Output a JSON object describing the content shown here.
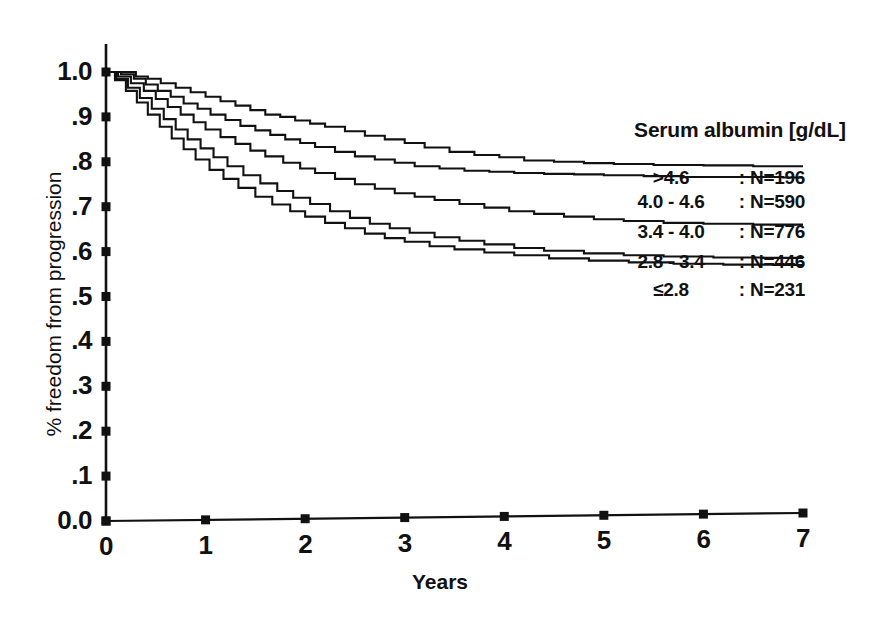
{
  "chart_data": {
    "type": "line",
    "title": "",
    "xlabel": "Years",
    "ylabel": "% freedom from progression",
    "xlim": [
      0,
      7
    ],
    "ylim": [
      0,
      1
    ],
    "grid": false,
    "legend_position": "right",
    "legend_title": "Serum albumin [g/dL]",
    "x_ticks": [
      "0",
      "1",
      "2",
      "3",
      "4",
      "5",
      "6",
      "7"
    ],
    "x_tick_values": [
      0,
      1,
      2,
      3,
      4,
      5,
      6,
      7
    ],
    "y_ticks": [
      "0.0",
      ".1",
      ".2",
      ".3",
      ".4",
      ".5",
      ".6",
      ".7",
      ".8",
      ".9",
      "1.0"
    ],
    "y_tick_values": [
      0,
      0.1,
      0.2,
      0.3,
      0.4,
      0.5,
      0.6,
      0.7,
      0.8,
      0.9,
      1.0
    ],
    "line_color": "#111111",
    "series": [
      {
        "name": ">4.6",
        "n_label": "N=196",
        "n": 196,
        "separator": ":",
        "x": [
          0,
          0.18,
          0.3,
          0.42,
          0.55,
          0.7,
          0.85,
          1.0,
          1.15,
          1.3,
          1.45,
          1.6,
          1.75,
          1.9,
          2.05,
          2.2,
          2.4,
          2.6,
          2.8,
          3.0,
          3.2,
          3.45,
          3.7,
          3.95,
          4.2,
          4.5,
          4.8,
          5.1,
          5.5,
          6.0,
          6.5,
          7.0
        ],
        "values": [
          1.0,
          1.0,
          0.99,
          0.985,
          0.975,
          0.965,
          0.955,
          0.945,
          0.935,
          0.925,
          0.915,
          0.905,
          0.9,
          0.892,
          0.885,
          0.878,
          0.868,
          0.858,
          0.85,
          0.842,
          0.832,
          0.822,
          0.815,
          0.81,
          0.803,
          0.8,
          0.797,
          0.795,
          0.793,
          0.792,
          0.79,
          0.79
        ]
      },
      {
        "name": "4.0 - 4.6",
        "n_label": "N=590",
        "n": 590,
        "separator": ":",
        "x": [
          0,
          0.15,
          0.28,
          0.4,
          0.52,
          0.65,
          0.78,
          0.92,
          1.05,
          1.2,
          1.35,
          1.5,
          1.65,
          1.8,
          1.95,
          2.1,
          2.3,
          2.5,
          2.7,
          2.9,
          3.1,
          3.35,
          3.6,
          3.85,
          4.1,
          4.4,
          4.7,
          5.0,
          5.4,
          5.8,
          6.3,
          6.8,
          7.0
        ],
        "values": [
          1.0,
          0.995,
          0.985,
          0.972,
          0.958,
          0.945,
          0.93,
          0.918,
          0.905,
          0.893,
          0.88,
          0.87,
          0.86,
          0.85,
          0.842,
          0.833,
          0.822,
          0.812,
          0.805,
          0.798,
          0.79,
          0.785,
          0.78,
          0.778,
          0.775,
          0.773,
          0.772,
          0.77,
          0.768,
          0.766,
          0.766,
          0.765,
          0.765
        ]
      },
      {
        "name": "3.4 - 4.0",
        "n_label": "N=776",
        "n": 776,
        "separator": ":",
        "x": [
          0,
          0.12,
          0.25,
          0.38,
          0.5,
          0.62,
          0.75,
          0.88,
          1.0,
          1.15,
          1.3,
          1.45,
          1.6,
          1.78,
          1.95,
          2.1,
          2.3,
          2.5,
          2.7,
          2.9,
          3.1,
          3.3,
          3.55,
          3.8,
          4.05,
          4.3,
          4.6,
          4.9,
          5.2,
          5.6,
          6.0,
          6.5,
          7.0
        ],
        "values": [
          1.0,
          0.99,
          0.975,
          0.958,
          0.94,
          0.922,
          0.905,
          0.888,
          0.872,
          0.855,
          0.84,
          0.825,
          0.812,
          0.798,
          0.785,
          0.775,
          0.762,
          0.75,
          0.74,
          0.73,
          0.722,
          0.715,
          0.706,
          0.698,
          0.69,
          0.684,
          0.678,
          0.672,
          0.668,
          0.664,
          0.662,
          0.66,
          0.66
        ]
      },
      {
        "name": "2.8 - 3.4",
        "n_label": "N=446",
        "n": 446,
        "separator": ":",
        "x": [
          0,
          0.1,
          0.22,
          0.34,
          0.46,
          0.58,
          0.7,
          0.82,
          0.95,
          1.08,
          1.22,
          1.38,
          1.55,
          1.72,
          1.88,
          2.05,
          2.25,
          2.45,
          2.65,
          2.85,
          3.05,
          3.3,
          3.55,
          3.8,
          4.1,
          4.4,
          4.8,
          5.2,
          5.6,
          6.1,
          6.6,
          7.0
        ],
        "values": [
          1.0,
          0.985,
          0.965,
          0.942,
          0.918,
          0.895,
          0.872,
          0.85,
          0.83,
          0.81,
          0.79,
          0.77,
          0.752,
          0.735,
          0.72,
          0.706,
          0.69,
          0.675,
          0.662,
          0.652,
          0.642,
          0.632,
          0.624,
          0.616,
          0.608,
          0.602,
          0.596,
          0.592,
          0.589,
          0.587,
          0.586,
          0.585
        ]
      },
      {
        "name": "≤2.8",
        "n_label": "N=231",
        "n": 231,
        "separator": ":",
        "x": [
          0,
          0.09,
          0.2,
          0.31,
          0.42,
          0.54,
          0.66,
          0.78,
          0.9,
          1.04,
          1.18,
          1.33,
          1.5,
          1.67,
          1.85,
          2.0,
          2.2,
          2.4,
          2.6,
          2.8,
          3.0,
          3.25,
          3.5,
          3.8,
          4.1,
          4.45,
          4.85,
          5.25,
          5.7,
          6.2,
          6.7,
          7.0
        ],
        "values": [
          1.0,
          0.982,
          0.958,
          0.932,
          0.905,
          0.878,
          0.852,
          0.828,
          0.805,
          0.782,
          0.762,
          0.742,
          0.722,
          0.705,
          0.69,
          0.678,
          0.664,
          0.652,
          0.64,
          0.63,
          0.622,
          0.612,
          0.605,
          0.598,
          0.592,
          0.585,
          0.58,
          0.576,
          0.573,
          0.571,
          0.57,
          0.57
        ]
      }
    ]
  },
  "legend": {
    "title": "Serum albumin [g/dL]"
  },
  "axes": {
    "x_title": "Years",
    "y_title": "% freedom from progression"
  }
}
